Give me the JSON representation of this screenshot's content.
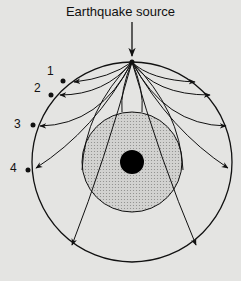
{
  "title": "Earthquake source",
  "stations": [
    {
      "label": "1"
    },
    {
      "label": "2"
    },
    {
      "label": "3"
    },
    {
      "label": "4"
    }
  ],
  "colors": {
    "background": "#e4e4e2",
    "line": "#111111",
    "outer_core_fill": "#c8c8c6",
    "inner_core_fill": "#000000"
  }
}
